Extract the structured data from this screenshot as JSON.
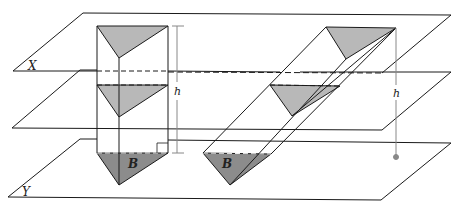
{
  "diagram": {
    "labels": {
      "plane_top": "X",
      "plane_bottom": "Y",
      "height_left": "h",
      "height_right": "h",
      "base_left": "B",
      "base_right": "B"
    },
    "colors": {
      "stroke": "#1a1a1a",
      "light_fill": "#b8b8b8",
      "dark_fill": "#8c8c8c",
      "guide": "#888888"
    }
  }
}
